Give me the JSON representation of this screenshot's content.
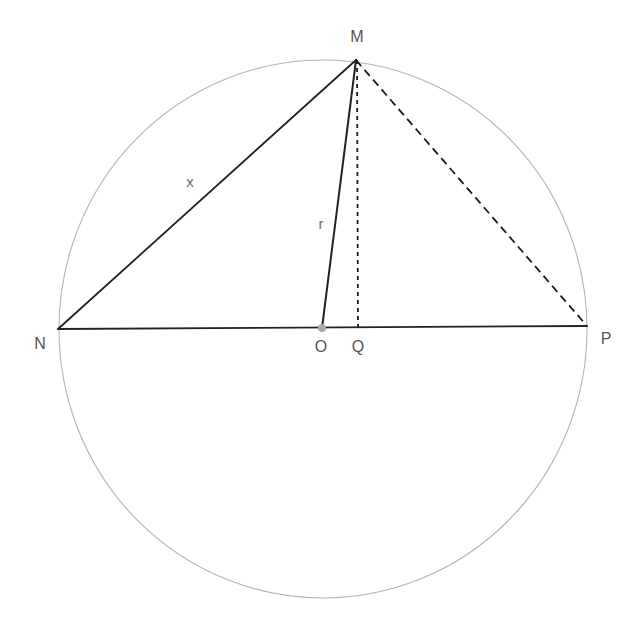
{
  "diagram": {
    "canvas": {
      "width": 642,
      "height": 627,
      "background": "#ffffff"
    },
    "colors": {
      "circle_stroke": "#b4b4b4",
      "solid_line": "#222222",
      "dashed_line": "#1a1a1a",
      "center_dot": "#aaaaaa",
      "vertex_label": "#555555",
      "measure_label": "#6d6d6d"
    },
    "circle": {
      "name": "circumscribed-circle",
      "center_x": 323,
      "center_y": 329,
      "radius": 264,
      "stroke_width": 1
    },
    "points": [
      {
        "id": "N",
        "label": "N",
        "x": 58,
        "y": 329,
        "label_x": 40,
        "label_y": 349,
        "marker": false
      },
      {
        "id": "M",
        "label": "M",
        "x": 356,
        "y": 60,
        "label_x": 357,
        "label_y": 42,
        "marker": false
      },
      {
        "id": "O",
        "label": "O",
        "x": 322,
        "y": 328,
        "label_x": 321,
        "label_y": 352,
        "marker": true
      },
      {
        "id": "Q",
        "label": "Q",
        "x": 358,
        "y": 328,
        "label_x": 358,
        "label_y": 352,
        "marker": false
      },
      {
        "id": "P",
        "label": "P",
        "x": 587,
        "y": 326,
        "label_x": 606,
        "label_y": 344,
        "marker": false
      }
    ],
    "center_dot": {
      "x": 322,
      "y": 328,
      "radius": 4
    },
    "segments": [
      {
        "id": "NP",
        "from": "N",
        "to": "P",
        "style": "solid",
        "x1": 58,
        "y1": 329,
        "x2": 587,
        "y2": 326,
        "width": 1.8,
        "dash": ""
      },
      {
        "id": "NM",
        "from": "N",
        "to": "M",
        "style": "solid",
        "x1": 58,
        "y1": 329,
        "x2": 356,
        "y2": 60,
        "width": 1.8,
        "dash": ""
      },
      {
        "id": "OM",
        "from": "O",
        "to": "M",
        "style": "solid",
        "x1": 322,
        "y1": 328,
        "x2": 356,
        "y2": 60,
        "width": 2.0,
        "dash": ""
      },
      {
        "id": "MQ",
        "from": "M",
        "to": "Q",
        "style": "dashed",
        "x1": 357,
        "y1": 60,
        "x2": 358,
        "y2": 328,
        "width": 1.8,
        "dash": "4 4"
      },
      {
        "id": "MP",
        "from": "M",
        "to": "P",
        "style": "dashed",
        "x1": 356,
        "y1": 60,
        "x2": 587,
        "y2": 326,
        "width": 1.8,
        "dash": "8 5"
      }
    ],
    "measures": [
      {
        "id": "x",
        "label": "x",
        "on_segment": "NM",
        "x": 190,
        "y": 187
      },
      {
        "id": "r",
        "label": "r",
        "on_segment": "OM",
        "x": 321,
        "y": 229
      }
    ]
  }
}
